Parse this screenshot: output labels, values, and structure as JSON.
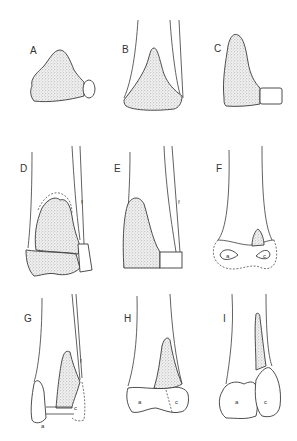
{
  "figure": {
    "panels": [
      {
        "id": "A",
        "label": "A"
      },
      {
        "id": "B",
        "label": "B"
      },
      {
        "id": "C",
        "label": "C"
      },
      {
        "id": "D",
        "label": "D",
        "annotations": [
          "f"
        ]
      },
      {
        "id": "E",
        "label": "E",
        "annotations": [
          "f"
        ]
      },
      {
        "id": "F",
        "label": "F",
        "annotations": [
          "a",
          "c"
        ]
      },
      {
        "id": "G",
        "label": "G",
        "annotations": [
          "f",
          "c",
          "a"
        ]
      },
      {
        "id": "H",
        "label": "H",
        "annotations": [
          "a",
          "c"
        ]
      },
      {
        "id": "I",
        "label": "I",
        "annotations": [
          "a",
          "c"
        ]
      }
    ],
    "colors": {
      "line": "#3a3a3a",
      "stipple": "#8a8a8a",
      "background": "#ffffff"
    }
  }
}
